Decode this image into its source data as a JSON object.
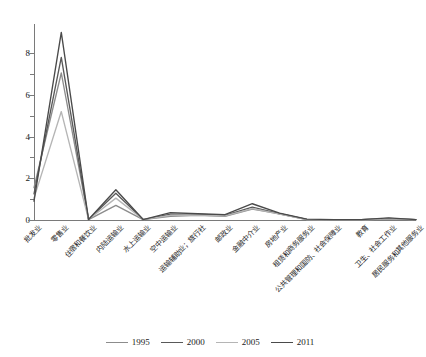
{
  "chart_data": {
    "type": "line",
    "title": "",
    "xlabel": "",
    "ylabel": "",
    "ylim": [
      0,
      9.4
    ],
    "yticks": [
      0,
      2,
      4,
      6,
      8
    ],
    "ytick_labels": [
      "0",
      "2",
      "4",
      "6",
      "8"
    ],
    "yminor_ticks": [
      1,
      3,
      5,
      7
    ],
    "grid": false,
    "legend_position": "bottom",
    "categories": [
      "批发业",
      "零售业",
      "住宿和餐饮业",
      "内陆运输业",
      "水上运输业",
      "空中运输业",
      "运输辅助业；旅行社",
      "邮政业",
      "金融中介业",
      "房地产业",
      "租赁和商务服务业",
      "公共管理和国防、社会保障业",
      "教育",
      "卫生、社会工作业",
      "居民服务和其他服务业"
    ],
    "series": [
      {
        "name": "1995",
        "color": "#8c8c8c",
        "values": [
          1.55,
          7.05,
          0.02,
          0.7,
          0.02,
          0.18,
          0.22,
          0.18,
          0.52,
          0.3,
          0.02,
          0.01,
          0.01,
          0.05,
          0.02
        ]
      },
      {
        "name": "2000",
        "color": "#595959",
        "values": [
          1.25,
          7.8,
          0.02,
          1.28,
          0.02,
          0.28,
          0.28,
          0.22,
          0.62,
          0.3,
          0.03,
          0.02,
          0.02,
          0.07,
          0.02
        ]
      },
      {
        "name": "2005",
        "color": "#b5b5b5",
        "values": [
          1.05,
          5.2,
          0.02,
          1.05,
          0.02,
          0.22,
          0.24,
          0.2,
          0.55,
          0.28,
          0.02,
          0.01,
          0.01,
          0.06,
          0.02
        ]
      },
      {
        "name": "2011",
        "color": "#4a4a4a",
        "values": [
          0.9,
          9.0,
          0.02,
          1.45,
          0.02,
          0.35,
          0.3,
          0.26,
          0.78,
          0.33,
          0.04,
          0.02,
          0.02,
          0.1,
          0.02
        ]
      }
    ]
  }
}
